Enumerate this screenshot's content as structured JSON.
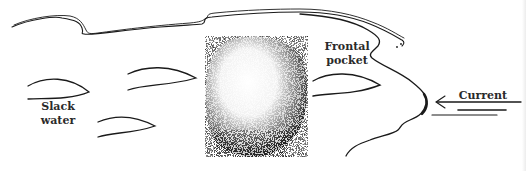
{
  "diagram": {
    "labels": {
      "frontal_pocket_line1": "Frontal",
      "frontal_pocket_line2": "pocket",
      "slack_water_line1": "Slack",
      "slack_water_line2": "water",
      "current": "Current"
    },
    "elements": {
      "rock": "boulder (stippled)",
      "fish_count": 4,
      "current_direction": "right-to-left"
    },
    "colors": {
      "ink": "#1a1a1a",
      "background": "#ffffff"
    }
  }
}
